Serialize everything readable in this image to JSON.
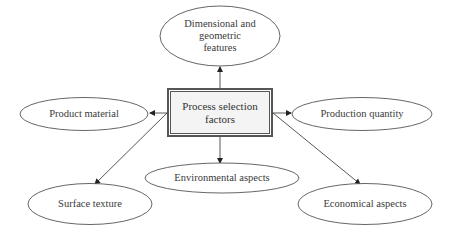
{
  "diagram": {
    "center": {
      "label": "Process selection\nfactors"
    },
    "nodes": [
      {
        "id": "dimensional",
        "label": "Dimensional and\ngeometric\nfeatures"
      },
      {
        "id": "product-material",
        "label": "Product material"
      },
      {
        "id": "production-quantity",
        "label": "Production quantity"
      },
      {
        "id": "environmental",
        "label": "Environmental aspects"
      },
      {
        "id": "surface-texture",
        "label": "Surface texture"
      },
      {
        "id": "economical",
        "label": "Economical aspects"
      }
    ],
    "edges": [
      {
        "from": "center",
        "to": "dimensional"
      },
      {
        "from": "center",
        "to": "product-material"
      },
      {
        "from": "center",
        "to": "production-quantity"
      },
      {
        "from": "center",
        "to": "environmental"
      },
      {
        "from": "center",
        "to": "surface-texture"
      },
      {
        "from": "center",
        "to": "economical"
      }
    ],
    "colors": {
      "stroke": "#555555",
      "center_fill": "#f4f4f4",
      "background": "#ffffff"
    }
  }
}
